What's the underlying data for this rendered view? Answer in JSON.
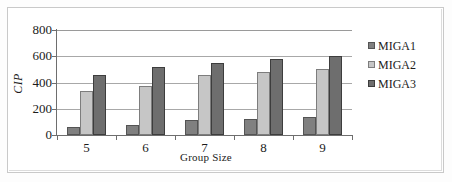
{
  "chart_data": {
    "type": "bar",
    "title": "",
    "xlabel": "Group Size",
    "ylabel": "CIP",
    "categories": [
      "5",
      "6",
      "7",
      "8",
      "9"
    ],
    "series": [
      {
        "name": "MIGA1",
        "color": "#808080",
        "values": [
          60,
          80,
          115,
          125,
          140
        ]
      },
      {
        "name": "MIGA2",
        "color": "#c6c6c6",
        "values": [
          335,
          375,
          455,
          480,
          500
        ]
      },
      {
        "name": "MIGA3",
        "color": "#6e6e6e",
        "values": [
          460,
          515,
          550,
          580,
          600
        ]
      }
    ],
    "ylim": [
      0,
      800
    ],
    "yticks": [
      0,
      200,
      400,
      600,
      800
    ],
    "ytick_labels": [
      "0",
      "200",
      "400",
      "600",
      "800"
    ],
    "grid": true,
    "grid_axis": "y",
    "legend_position": "right"
  },
  "figure": {
    "frame_color": "#c9c9c9",
    "background": "#ffffff",
    "axis_color": "#6e6e6e",
    "gridline_color": "#a8a8a8",
    "text_color": "#1b1b1b"
  }
}
